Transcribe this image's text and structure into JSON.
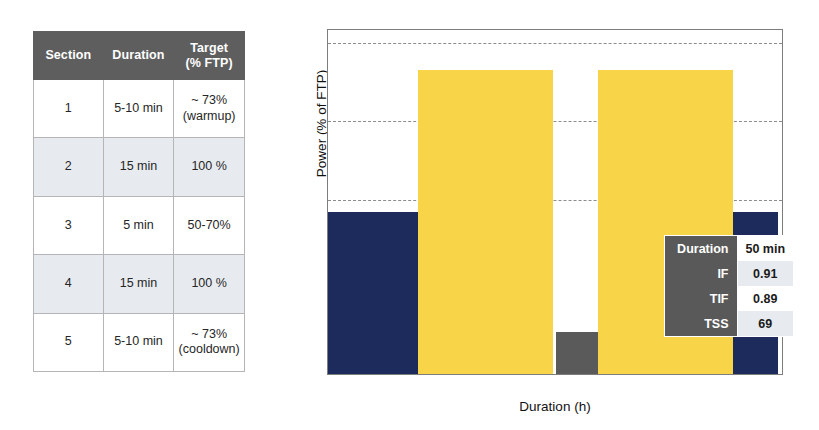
{
  "workout_table": {
    "headers": [
      {
        "line1": "Section",
        "line2": ""
      },
      {
        "line1": "Duration",
        "line2": ""
      },
      {
        "line1": "Target",
        "line2": "(% FTP)"
      }
    ],
    "rows": [
      {
        "section": "1",
        "duration": "5-10 min",
        "target": "~ 73%",
        "target_note": "(warmup)"
      },
      {
        "section": "2",
        "duration": "15 min",
        "target": "100 %",
        "target_note": ""
      },
      {
        "section": "3",
        "duration": "5 min",
        "target": "50-70%",
        "target_note": ""
      },
      {
        "section": "4",
        "duration": "15 min",
        "target": "100 %",
        "target_note": ""
      },
      {
        "section": "5",
        "duration": "5-10 min",
        "target": "~ 73%",
        "target_note": "(cooldown)"
      }
    ]
  },
  "metrics_inset": {
    "rows": [
      {
        "key": "Duration",
        "value": "50 min"
      },
      {
        "key": "IF",
        "value": "0.91"
      },
      {
        "key": "TIF",
        "value": "0.89"
      },
      {
        "key": "TSS",
        "value": "69"
      }
    ]
  },
  "chart_data": {
    "type": "bar",
    "title": "",
    "xlabel": "Duration (h)",
    "ylabel": "Power (% of FTP)",
    "xlim": [
      0.0,
      0.845
    ],
    "ylim": [
      42,
      108
    ],
    "xticks": [
      "0.0",
      "0.1",
      "0.2",
      "0.3",
      "0.4",
      "0.5",
      "0.6",
      "0.7",
      "0.8"
    ],
    "xtick_values": [
      0.0,
      0.1,
      0.2,
      0.3,
      0.4,
      0.5,
      0.6,
      0.7,
      0.8
    ],
    "yticks": [
      "50",
      "60",
      "70",
      "80",
      "90",
      "100"
    ],
    "ytick_values": [
      50,
      60,
      70,
      80,
      90,
      100
    ],
    "grid": true,
    "gridlines": [
      75,
      90,
      105
    ],
    "legend": "none",
    "colors": {
      "warmup_cooldown": "#1d2b5c",
      "interval": "#f8d548",
      "recovery": "#5a5a5a"
    },
    "bars": [
      {
        "label": "Section 1 warmup",
        "x_start": 0.0,
        "x_end": 0.167,
        "value": 73,
        "color": "#1d2b5c"
      },
      {
        "label": "Section 2 interval",
        "x_start": 0.167,
        "x_end": 0.417,
        "value": 100,
        "color": "#f8d548"
      },
      {
        "label": "Section 3 recovery",
        "x_start": 0.423,
        "x_end": 0.5,
        "value": 50,
        "color": "#5a5a5a"
      },
      {
        "label": "Section 4 interval",
        "x_start": 0.5,
        "x_end": 0.75,
        "value": 100,
        "color": "#f8d548"
      },
      {
        "label": "Section 5 cooldown",
        "x_start": 0.75,
        "x_end": 0.833,
        "value": 73,
        "color": "#1d2b5c"
      }
    ]
  }
}
